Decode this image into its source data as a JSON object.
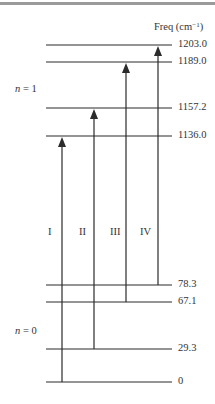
{
  "header": {
    "freq_label": "Freq (cm",
    "freq_unit_exp": "−1",
    "freq_close": ")"
  },
  "manifolds": [
    {
      "label_var": "n",
      "label_eq": " = 1",
      "x": 15,
      "y": 84
    },
    {
      "label_var": "n",
      "label_eq": " = 0",
      "x": 15,
      "y": 326
    }
  ],
  "levels": [
    {
      "value": "1203.0",
      "y": 45
    },
    {
      "value": "1189.0",
      "y": 62
    },
    {
      "value": "1157.2",
      "y": 108
    },
    {
      "value": "1136.0",
      "y": 136
    },
    {
      "value": "78.3",
      "y": 285
    },
    {
      "value": "67.1",
      "y": 302
    },
    {
      "value": "29.3",
      "y": 349
    },
    {
      "value": "0",
      "y": 382
    }
  ],
  "transitions": [
    {
      "label": "I",
      "x": 62,
      "from": "0",
      "to": "1136.0",
      "y_from": 382,
      "y_to": 136,
      "label_x": 48
    },
    {
      "label": "II",
      "x": 94,
      "from": "29.3",
      "to": "1157.2",
      "y_from": 349,
      "y_to": 108,
      "label_x": 79
    },
    {
      "label": "III",
      "x": 126,
      "from": "67.1",
      "to": "1189.0",
      "y_from": 302,
      "y_to": 62,
      "label_x": 110
    },
    {
      "label": "IV",
      "x": 158,
      "from": "78.3",
      "to": "1203.0",
      "y_from": 285,
      "y_to": 45,
      "label_x": 140
    }
  ],
  "colors": {
    "line": "#2b2b2b",
    "rule": "#9a9a9a"
  }
}
